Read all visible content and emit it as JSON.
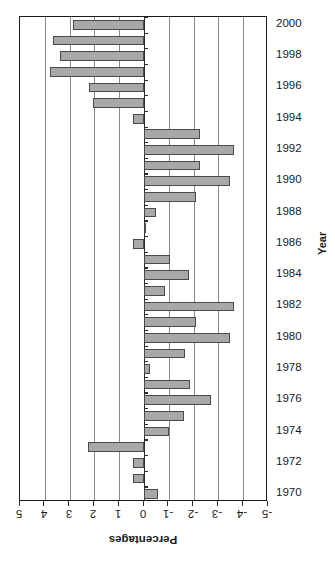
{
  "chart_data": {
    "type": "bar",
    "orientation": "horizontal",
    "title": "",
    "xlabel": "Percentages",
    "ylabel": "Year",
    "xlim": [
      5,
      -5
    ],
    "xticks": [
      "5",
      "4",
      "3",
      "2",
      "1",
      "0",
      "-1",
      "-2",
      "-3",
      "-4",
      "-5"
    ],
    "xtick_values": [
      5,
      4,
      3,
      2,
      1,
      0,
      -1,
      -2,
      -3,
      -4,
      -5
    ],
    "grid": true,
    "legend": null,
    "rotated_180_xaxis": true,
    "categories": [
      2000,
      1999,
      1998,
      1997,
      1996,
      1995,
      1994,
      1993,
      1992,
      1991,
      1990,
      1989,
      1988,
      1987,
      1986,
      1985,
      1984,
      1983,
      1982,
      1981,
      1980,
      1979,
      1978,
      1977,
      1976,
      1975,
      1974,
      1973,
      1972,
      1971,
      1970
    ],
    "values": [
      2.86,
      3.67,
      3.39,
      3.79,
      2.22,
      2.06,
      0.45,
      -2.26,
      -3.63,
      -2.26,
      -3.45,
      -2.1,
      -0.5,
      -0.08,
      0.45,
      -1.05,
      -1.8,
      -0.85,
      -3.63,
      -2.1,
      -3.45,
      -1.65,
      -0.25,
      -1.85,
      -2.7,
      -1.6,
      -1.0,
      2.26,
      0.45,
      0.45,
      -0.55
    ],
    "ytick_labels": [
      "2000",
      "1998",
      "1996",
      "1994",
      "1992",
      "1990",
      "1988",
      "1986",
      "1984",
      "1982",
      "1980",
      "1978",
      "1976",
      "1974",
      "1972",
      "1970"
    ],
    "bar_color": "#a8a8a8",
    "bar_edge_color": "#4a4a4a"
  },
  "axes": {
    "year_axis_title": "Year",
    "pct_axis_title": "Percentages"
  }
}
